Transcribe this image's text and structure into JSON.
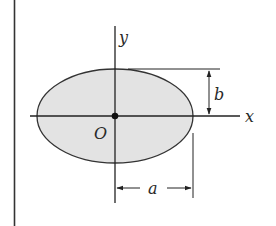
{
  "diagram": {
    "labels": {
      "y_axis": "y",
      "x_axis": "x",
      "origin": "O",
      "semi_minor": "b",
      "semi_major": "a"
    },
    "shape": {
      "type": "ellipse",
      "fill_color": "#e3e3e3",
      "stroke_color": "#333333"
    },
    "colors": {
      "line": "#222222",
      "fill": "#e3e3e3",
      "background": "#ffffff"
    }
  }
}
